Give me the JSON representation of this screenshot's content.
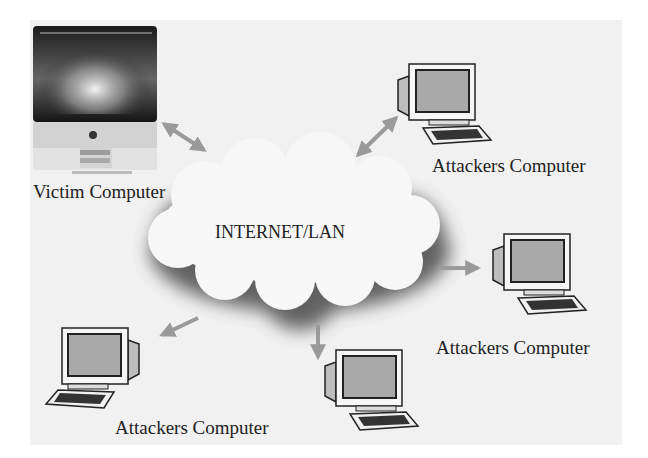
{
  "diagram": {
    "type": "network-topology",
    "center": {
      "label": "INTERNET/LAN"
    },
    "nodes": [
      {
        "id": "victim",
        "label": "Victim Computer",
        "kind": "imac"
      },
      {
        "id": "attacker-top-right",
        "label": "Attackers Computer",
        "kind": "crt-pc"
      },
      {
        "id": "attacker-right",
        "label": "Attackers Computer",
        "kind": "crt-pc"
      },
      {
        "id": "attacker-bottom-center",
        "label": "",
        "kind": "crt-pc"
      },
      {
        "id": "attacker-bottom-left",
        "label": "Attackers Computer",
        "kind": "crt-pc"
      }
    ],
    "edges": [
      {
        "from": "victim",
        "to": "cloud",
        "style": "double-arrow"
      },
      {
        "from": "cloud",
        "to": "attacker-top-right",
        "style": "double-arrow"
      },
      {
        "from": "cloud",
        "to": "attacker-right",
        "style": "arrow"
      },
      {
        "from": "cloud",
        "to": "attacker-bottom-center",
        "style": "arrow"
      },
      {
        "from": "cloud",
        "to": "attacker-bottom-left",
        "style": "arrow"
      }
    ]
  },
  "colors": {
    "background": "#f1f1f1",
    "arrow": "#9a9a9a",
    "cloud_fill": "#f7f7f7",
    "cloud_shadow": "#555555",
    "pc_screen": "#a9a9a9",
    "outline": "#222222"
  }
}
